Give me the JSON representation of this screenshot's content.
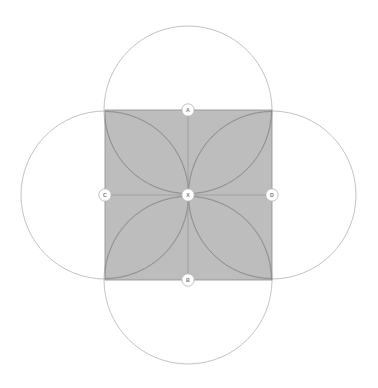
{
  "figure": {
    "canvas": {
      "width": 378,
      "height": 388
    },
    "background_color": "#ffffff"
  },
  "colors": {
    "square_fill": "#ababab",
    "square_stroke": "#8c8c8c",
    "circle_stroke": "#b3b3b3",
    "arc_stroke": "#8a8a8a",
    "axis_stroke": "#9a9a9a",
    "badge_fill": "#ffffff",
    "badge_stroke": "#b0b0b0",
    "label_text": "#7a7a7a"
  },
  "geometry": {
    "center": {
      "x": 188,
      "y": 195
    },
    "square": {
      "x": 105,
      "y": 110,
      "width": 167,
      "height": 170
    },
    "circle_radius": 84,
    "petal_radius": 83.5,
    "badge_radius": 6.2
  },
  "points": [
    {
      "id": "A",
      "label": "A",
      "role": "top-midpoint",
      "cx": 188,
      "cy": 110
    },
    {
      "id": "B",
      "label": "B",
      "role": "bottom-midpoint",
      "cx": 188,
      "cy": 280
    },
    {
      "id": "C",
      "label": "C",
      "role": "left-midpoint",
      "cx": 105,
      "cy": 195
    },
    {
      "id": "D",
      "label": "D",
      "role": "right-midpoint",
      "cx": 272,
      "cy": 195
    },
    {
      "id": "X",
      "label": "X",
      "role": "center",
      "cx": 188,
      "cy": 195
    }
  ],
  "circles": [
    {
      "id": "circle-A",
      "center_point": "A",
      "cx": 188,
      "cy": 110,
      "r": 84
    },
    {
      "id": "circle-B",
      "center_point": "B",
      "cx": 188,
      "cy": 280,
      "r": 84
    },
    {
      "id": "circle-C",
      "center_point": "C",
      "cx": 105,
      "cy": 195,
      "r": 84
    },
    {
      "id": "circle-D",
      "center_point": "D",
      "cx": 272,
      "cy": 195,
      "r": 84
    }
  ],
  "axes": [
    {
      "id": "axis-horizontal",
      "from": "C",
      "to": "D",
      "x1": 105,
      "y1": 195,
      "x2": 272,
      "y2": 195
    },
    {
      "id": "axis-vertical",
      "from": "A",
      "to": "B",
      "x1": 188,
      "y1": 110,
      "x2": 188,
      "y2": 280
    }
  ]
}
